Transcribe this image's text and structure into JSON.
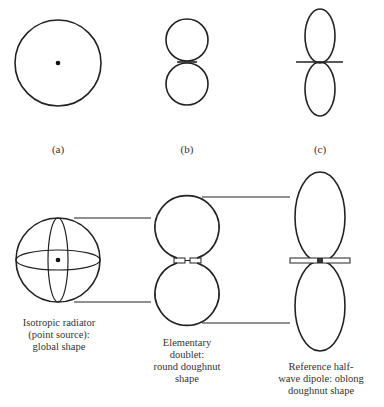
{
  "figure": {
    "top_row": {
      "labels": [
        "(a)",
        "(b)",
        "(c)"
      ],
      "shapes": [
        "circle-with-point-source",
        "figure-eight-doublet",
        "elongated-figure-eight-dipole"
      ]
    },
    "bottom_row": {
      "captions": [
        "Isotropic radiator\n(point source):\nglobal shape",
        "Elementary\ndoublet:\nround doughnut\nshape",
        "Reference half-\nwave dipole: oblong\ndoughnut shape"
      ],
      "shapes": [
        "sphere",
        "round-doughnut",
        "oblong-doughnut"
      ]
    },
    "stroke_color": "#222222"
  }
}
